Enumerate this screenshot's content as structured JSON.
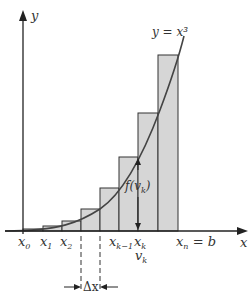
{
  "diagram": {
    "type": "riemann-sum-right-endpoint",
    "curve_label": "y = x³",
    "axes": {
      "x_label": "x",
      "y_label": "y"
    },
    "x_ticks": [
      {
        "base": "x",
        "sub": "0"
      },
      {
        "base": "x",
        "sub": "1"
      },
      {
        "base": "x",
        "sub": "2"
      },
      {
        "base": "x",
        "sub": "k−1"
      },
      {
        "base": "x",
        "sub": "k"
      },
      {
        "base": "x",
        "sub": "n",
        "suffix": " = b"
      }
    ],
    "sample_point": {
      "base": "v",
      "sub": "k"
    },
    "height_label": {
      "prefix": "f(",
      "base": "v",
      "sub": "k",
      "suffix": ")"
    },
    "width_label": "Δx",
    "colors": {
      "bar_fill": "#d6d6d6",
      "bar_stroke": "#333333",
      "curve": "#444444",
      "axis": "#222222",
      "text": "#333333"
    }
  }
}
